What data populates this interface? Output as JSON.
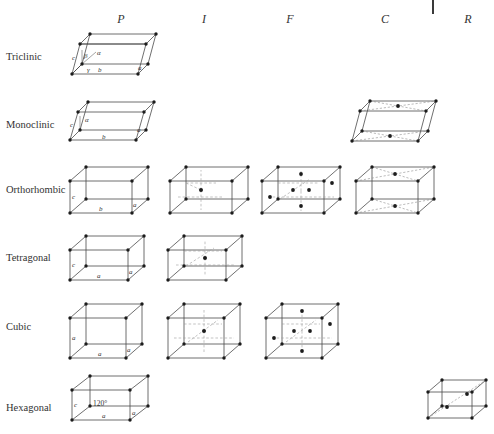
{
  "figure": {
    "background": "#ffffff",
    "line_color": "#4a4a4a",
    "node_color": "#1c1c1c",
    "hidden_line_color": "#9a9a9a"
  },
  "columns": [
    {
      "key": "P",
      "label": "P",
      "x": 121
    },
    {
      "key": "I",
      "label": "I",
      "x": 204
    },
    {
      "key": "F",
      "label": "F",
      "x": 290
    },
    {
      "key": "C",
      "label": "C",
      "x": 385
    },
    {
      "key": "R",
      "label": "R",
      "x": 468
    }
  ],
  "column_tick": {
    "name": "column-divider-tick",
    "x": 432,
    "y": 0,
    "height": 14
  },
  "rows": [
    {
      "key": "triclinic",
      "label": "Triclinic",
      "y": 57
    },
    {
      "key": "monoclinic",
      "label": "Monoclinic",
      "y": 125
    },
    {
      "key": "orthorhombic",
      "label": "Orthorhombic",
      "y": 190
    },
    {
      "key": "tetragonal",
      "label": "Tetragonal",
      "y": 258
    },
    {
      "key": "cubic",
      "label": "Cubic",
      "y": 327
    },
    {
      "key": "hexagonal",
      "label": "Hexagonal",
      "y": 408
    }
  ],
  "cells": [
    {
      "row": "triclinic",
      "column": "P",
      "shape": "triclinic-prism",
      "labels": [
        "c",
        "β",
        "α",
        "γ",
        "b",
        "a"
      ],
      "centering": "primitive"
    },
    {
      "row": "monoclinic",
      "column": "P",
      "shape": "monoclinic-prism",
      "labels": [
        "c",
        "α",
        "b",
        "a"
      ],
      "centering": "primitive"
    },
    {
      "row": "monoclinic",
      "column": "C",
      "shape": "monoclinic-prism",
      "labels": [],
      "centering": "base-centered"
    },
    {
      "row": "orthorhombic",
      "column": "P",
      "shape": "orthorhombic-box",
      "labels": [
        "c",
        "b",
        "a"
      ],
      "centering": "primitive"
    },
    {
      "row": "orthorhombic",
      "column": "I",
      "shape": "orthorhombic-box",
      "labels": [],
      "centering": "body-centered"
    },
    {
      "row": "orthorhombic",
      "column": "F",
      "shape": "orthorhombic-box",
      "labels": [],
      "centering": "face-centered"
    },
    {
      "row": "orthorhombic",
      "column": "C",
      "shape": "orthorhombic-box",
      "labels": [],
      "centering": "base-centered"
    },
    {
      "row": "tetragonal",
      "column": "P",
      "shape": "tetragonal-box",
      "labels": [
        "c",
        "a",
        "a"
      ],
      "centering": "primitive"
    },
    {
      "row": "tetragonal",
      "column": "I",
      "shape": "tetragonal-box",
      "labels": [],
      "centering": "body-centered"
    },
    {
      "row": "cubic",
      "column": "P",
      "shape": "cube",
      "labels": [
        "a",
        "a",
        "a"
      ],
      "centering": "primitive"
    },
    {
      "row": "cubic",
      "column": "I",
      "shape": "cube",
      "labels": [],
      "centering": "body-centered"
    },
    {
      "row": "cubic",
      "column": "F",
      "shape": "cube",
      "labels": [],
      "centering": "face-centered"
    },
    {
      "row": "hexagonal",
      "column": "P",
      "shape": "hexagonal-prism",
      "labels": [
        "c",
        "120°",
        "a",
        "a"
      ],
      "centering": "primitive"
    },
    {
      "row": "hexagonal",
      "column": "R",
      "shape": "rhombohedral-cell",
      "labels": [],
      "centering": "rhombohedral"
    }
  ],
  "cell_labels": {
    "a": "a",
    "b": "b",
    "c": "c",
    "alpha": "α",
    "beta": "β",
    "gamma": "γ",
    "angle120": "120°"
  }
}
